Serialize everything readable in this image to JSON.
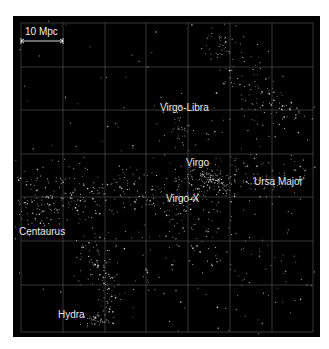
{
  "figure": {
    "background": "#000000",
    "grid_color": "#5a5a5a",
    "point_color": "#e6e6e6",
    "scale_bar": {
      "label": "10 Mpc",
      "x1": 21,
      "x2": 63,
      "y": 41
    },
    "grid": {
      "x": [
        21,
        63,
        105,
        146,
        188,
        230,
        272,
        313
      ],
      "y": [
        23,
        67,
        110,
        154,
        197,
        241,
        285,
        332
      ]
    },
    "labels": [
      {
        "id": "virgo-libra",
        "text": "Virgo-Libra",
        "x": 160,
        "y": 108
      },
      {
        "id": "virgo",
        "text": "Virgo",
        "x": 186,
        "y": 163
      },
      {
        "id": "ursa-major",
        "text": "Ursa Major",
        "x": 254,
        "y": 182
      },
      {
        "id": "virgo-x",
        "text": "Virgo-X",
        "x": 166,
        "y": 199
      },
      {
        "id": "centaurus",
        "text": "Centaurus",
        "x": 19,
        "y": 232
      },
      {
        "id": "hydra",
        "text": "Hydra",
        "x": 58,
        "y": 315
      }
    ],
    "clusters": [
      {
        "name": "upper-right-filament",
        "cx": 250,
        "cy": 80,
        "sx": 14,
        "sy": 30,
        "n": 90,
        "rot": -0.5
      },
      {
        "name": "upper-right-top",
        "cx": 222,
        "cy": 45,
        "sx": 12,
        "sy": 8,
        "n": 25,
        "rot": 0
      },
      {
        "name": "right-top-2",
        "cx": 285,
        "cy": 110,
        "sx": 16,
        "sy": 8,
        "n": 35,
        "rot": 0
      },
      {
        "name": "virgo-libra",
        "cx": 183,
        "cy": 127,
        "sx": 6,
        "sy": 10,
        "n": 30,
        "rot": 0
      },
      {
        "name": "virgo-core",
        "cx": 212,
        "cy": 179,
        "sx": 6,
        "sy": 3,
        "n": 70,
        "rot": 0.3
      },
      {
        "name": "virgo-halo",
        "cx": 205,
        "cy": 180,
        "sx": 18,
        "sy": 10,
        "n": 60,
        "rot": 0
      },
      {
        "name": "ursa-major",
        "cx": 265,
        "cy": 175,
        "sx": 26,
        "sy": 9,
        "n": 90,
        "rot": 0
      },
      {
        "name": "central-band",
        "cx": 130,
        "cy": 185,
        "sx": 55,
        "sy": 12,
        "n": 150,
        "rot": 0.05
      },
      {
        "name": "virgo-x",
        "cx": 180,
        "cy": 202,
        "sx": 12,
        "sy": 8,
        "n": 35,
        "rot": 0
      },
      {
        "name": "lower-mid",
        "cx": 200,
        "cy": 230,
        "sx": 40,
        "sy": 18,
        "n": 70,
        "rot": 0
      },
      {
        "name": "centaurus",
        "cx": 40,
        "cy": 205,
        "sx": 18,
        "sy": 16,
        "n": 110,
        "rot": 0
      },
      {
        "name": "centaurus-link",
        "cx": 75,
        "cy": 200,
        "sx": 18,
        "sy": 8,
        "n": 40,
        "rot": 0.3
      },
      {
        "name": "hydra-filament",
        "cx": 100,
        "cy": 275,
        "sx": 9,
        "sy": 30,
        "n": 120,
        "rot": -0.35
      },
      {
        "name": "hydra-core",
        "cx": 95,
        "cy": 320,
        "sx": 5,
        "sy": 3,
        "n": 40,
        "rot": 0
      },
      {
        "name": "lower-right",
        "cx": 240,
        "cy": 270,
        "sx": 40,
        "sy": 25,
        "n": 50,
        "rot": 0
      },
      {
        "name": "background",
        "cx": 167,
        "cy": 177,
        "sx": 90,
        "sy": 90,
        "n": 220,
        "rot": 0
      }
    ]
  }
}
